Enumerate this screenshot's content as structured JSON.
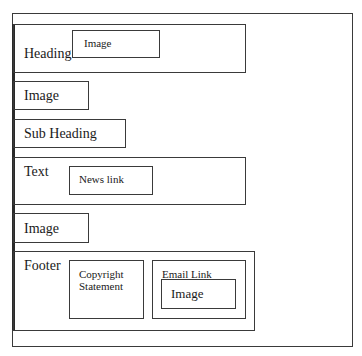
{
  "diagram": {
    "type": "website-wireframe",
    "outer_frame": {
      "label": ""
    },
    "sections": {
      "heading": {
        "label": "Heading",
        "image": {
          "label": "Image"
        }
      },
      "image_1": {
        "label": "Image"
      },
      "sub_heading": {
        "label": "Sub Heading"
      },
      "text": {
        "label": "Text",
        "news_link": {
          "label": "News link"
        }
      },
      "image_2": {
        "label": "Image"
      },
      "footer": {
        "label": "Footer",
        "copyright": {
          "line1": "Copyright",
          "line2": "Statement"
        },
        "email_link": {
          "label": "Email Link",
          "image": {
            "label": "Image"
          }
        }
      }
    }
  },
  "colors": {
    "border": "#3a3a3a",
    "background": "#ffffff",
    "text": "#1a1a1a"
  }
}
